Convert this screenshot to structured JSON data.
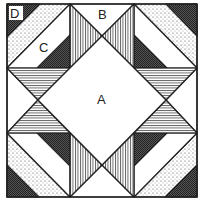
{
  "diagram": {
    "type": "quilt-block",
    "labels": {
      "A": "A",
      "B": "B",
      "C": "C",
      "D": "D"
    },
    "colors": {
      "line": "#222222",
      "background": "#ffffff",
      "dark": "#333333"
    },
    "patterns": [
      "dotted",
      "crosshatch-dark",
      "vertical-lines",
      "horizontal-lines",
      "plain-white"
    ]
  }
}
